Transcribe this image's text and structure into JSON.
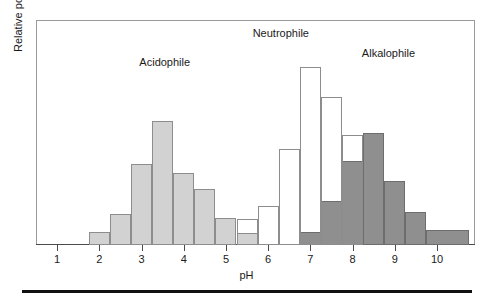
{
  "figure": {
    "x_axis_title": "pH",
    "y_axis_title": "Relative population density",
    "x_tick_labels": [
      "1",
      "2",
      "3",
      "4",
      "5",
      "6",
      "7",
      "8",
      "9",
      "10"
    ],
    "series_labels": {
      "acidophile": "Acidophile",
      "neutrophile": "Neutrophile",
      "alkalophile": "Alkalophile"
    },
    "colors": {
      "acidophile_fill": "#d2d2d2",
      "neutrophile_fill": "#ffffff",
      "alkalophile_fill": "#8f8f8f",
      "bar_stroke": "#8d8d8d",
      "axis": "#4a4a4a",
      "frame": "#9a9a9a",
      "rule": "#111111"
    }
  },
  "chart_data": {
    "type": "bar",
    "title": "",
    "subtitle": "",
    "xlabel": "pH",
    "ylabel": "Relative population density",
    "xlim": [
      0.5,
      10.9
    ],
    "ylim": [
      0,
      1.0
    ],
    "grid": false,
    "legend_position": "in-plot-annotations",
    "bin_width": 0.5,
    "x_ticks": [
      1,
      2,
      3,
      4,
      5,
      6,
      7,
      8,
      9,
      10
    ],
    "x_tick_labels": [
      "1",
      "2",
      "3",
      "4",
      "5",
      "6",
      "7",
      "8",
      "9",
      "10"
    ],
    "y_ticks": [],
    "y_tick_labels": [],
    "annotations": [
      {
        "text": "Acidophile",
        "x": 3.55,
        "y": 0.84
      },
      {
        "text": "Neutrophile",
        "x": 6.3,
        "y": 0.97
      },
      {
        "text": "Alkalophile",
        "x": 8.85,
        "y": 0.88
      }
    ],
    "series": [
      {
        "name": "Acidophile",
        "fill": "#d2d2d2",
        "bins": [
          {
            "x_start": 1.75,
            "x_end": 2.25,
            "value": 0.06
          },
          {
            "x_start": 2.25,
            "x_end": 2.75,
            "value": 0.14
          },
          {
            "x_start": 2.75,
            "x_end": 3.25,
            "value": 0.36
          },
          {
            "x_start": 3.25,
            "x_end": 3.75,
            "value": 0.55
          },
          {
            "x_start": 3.75,
            "x_end": 4.25,
            "value": 0.32
          },
          {
            "x_start": 4.25,
            "x_end": 4.75,
            "value": 0.25
          },
          {
            "x_start": 4.75,
            "x_end": 5.25,
            "value": 0.12
          },
          {
            "x_start": 5.25,
            "x_end": 5.75,
            "value": 0.055
          }
        ]
      },
      {
        "name": "Neutrophile",
        "fill": "#ffffff",
        "bins": [
          {
            "x_start": 5.25,
            "x_end": 5.75,
            "value": 0.115
          },
          {
            "x_start": 5.75,
            "x_end": 6.25,
            "value": 0.175
          },
          {
            "x_start": 6.25,
            "x_end": 6.75,
            "value": 0.425
          },
          {
            "x_start": 6.75,
            "x_end": 7.25,
            "value": 0.79
          },
          {
            "x_start": 7.25,
            "x_end": 7.75,
            "value": 0.66
          },
          {
            "x_start": 7.75,
            "x_end": 8.25,
            "value": 0.49
          }
        ]
      },
      {
        "name": "Alkalophile",
        "fill": "#8f8f8f",
        "bins": [
          {
            "x_start": 6.75,
            "x_end": 7.25,
            "value": 0.06
          },
          {
            "x_start": 7.25,
            "x_end": 7.75,
            "value": 0.195
          },
          {
            "x_start": 7.75,
            "x_end": 8.25,
            "value": 0.375
          },
          {
            "x_start": 8.25,
            "x_end": 8.75,
            "value": 0.5
          },
          {
            "x_start": 8.75,
            "x_end": 9.25,
            "value": 0.285
          },
          {
            "x_start": 9.25,
            "x_end": 9.75,
            "value": 0.145
          },
          {
            "x_start": 9.75,
            "x_end": 10.75,
            "value": 0.065
          }
        ]
      }
    ]
  }
}
